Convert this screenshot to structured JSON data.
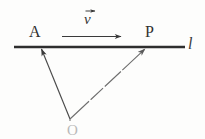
{
  "figure": {
    "type": "geometry-vector-diagram",
    "background_color": "#fdfdfc",
    "ink_color": "#333333",
    "labels": {
      "point_a": "A",
      "point_p": "P",
      "line_l": "l",
      "point_o": "O",
      "velocity": "v"
    },
    "geometry": {
      "line_l": {
        "x1": 14,
        "y1": 47,
        "x2": 185,
        "y2": 47
      },
      "point_a": {
        "x": 41,
        "y": 47
      },
      "point_p": {
        "x": 146,
        "y": 47
      },
      "point_o": {
        "x": 70,
        "y": 120
      },
      "velocity_arrow": {
        "x1": 62,
        "y1": 36,
        "x2": 124,
        "y2": 36
      },
      "vector_oa": {
        "from": "O",
        "to": "A",
        "style": "solid",
        "arrowhead": "at-A"
      },
      "vector_op": {
        "from": "O",
        "to": "P",
        "style": "faint-broken",
        "arrowhead": "at-P"
      }
    },
    "annotations": {
      "v_overbar_arrow": "vector-arrow-over-v"
    }
  }
}
